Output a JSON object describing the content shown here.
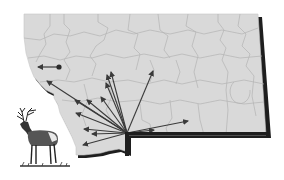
{
  "map": {
    "region": "Montana",
    "subject": "elk dispersal from southwest origin",
    "colors": {
      "background": "#ffffff",
      "land_fill": "#d9d9d9",
      "county_lines": "#b5b5b5",
      "border_shadow": "#1e1e1e",
      "arrow": "#3a3a3a"
    },
    "origin": {
      "x": 127,
      "y": 133
    },
    "arrows": [
      {
        "id": "a1",
        "to": [
          111,
          72
        ]
      },
      {
        "id": "a2",
        "to": [
          107,
          75
        ]
      },
      {
        "id": "a3",
        "to": [
          106,
          83
        ]
      },
      {
        "id": "a4",
        "to": [
          153,
          71
        ]
      },
      {
        "id": "a5",
        "to": [
          101,
          97
        ]
      },
      {
        "id": "a6",
        "to": [
          75,
          100
        ]
      },
      {
        "id": "a7",
        "to": [
          87,
          100
        ]
      },
      {
        "id": "a8",
        "to": [
          76,
          113
        ]
      },
      {
        "id": "a9",
        "to": [
          84,
          129
        ]
      },
      {
        "id": "a10",
        "to": [
          92,
          134
        ]
      },
      {
        "id": "a11",
        "to": [
          83,
          145
        ]
      },
      {
        "id": "a12",
        "to": [
          188,
          121
        ]
      },
      {
        "id": "a13",
        "to": [
          154,
          130
        ]
      },
      {
        "id": "a14",
        "to": [
          47,
          81
        ]
      }
    ],
    "isolated_arrow": {
      "from": [
        59,
        67
      ],
      "to": [
        38,
        67
      ]
    },
    "illustration": "elk"
  }
}
